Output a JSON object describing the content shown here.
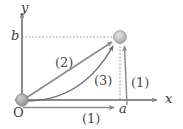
{
  "figure": {
    "type": "physics-path-diagram",
    "background_color": "#ffffff",
    "axes": {
      "x_label": "x",
      "y_label": "y",
      "origin_label": "O",
      "axis_color": "#8c8c8c",
      "origin": {
        "x": 22,
        "y": 100
      },
      "x_axis_end": {
        "x": 162,
        "y": 100
      },
      "y_axis_end": {
        "x": 22,
        "y": 10
      }
    },
    "tick_labels": {
      "x_tick": "a",
      "y_tick": "b"
    },
    "target_point": {
      "x": 120,
      "y": 37,
      "radius": 6,
      "fill_color": "#bdbdbd",
      "edge_color": "#9a9a9a"
    },
    "origin_point": {
      "x": 22,
      "y": 100,
      "radius": 6,
      "fill_color": "#a8a8a8",
      "edge_color": "#8a8a8a"
    },
    "guide_lines": {
      "style": "dotted",
      "color": "#9a9a9a",
      "horizontal_from_b": {
        "x1": 22,
        "y1": 37,
        "x2": 116,
        "y2": 37
      },
      "vertical_from_a": {
        "x1": 120,
        "y1": 96,
        "x2": 120,
        "y2": 44
      }
    },
    "paths": [
      {
        "id": "path-1-horizontal",
        "label": "(1)",
        "description": "horizontal segment along x from O to a",
        "style": "straight-arrow",
        "color": "#8c8c8c"
      },
      {
        "id": "path-1-vertical",
        "label": "(1)",
        "description": "vertical segment from a up to target point",
        "style": "straight-arrow",
        "color": "#8c8c8c"
      },
      {
        "id": "path-2-diagonal",
        "label": "(2)",
        "description": "straight diagonal arrow from O to target point",
        "style": "straight-arrow",
        "color": "#8c8c8c"
      },
      {
        "id": "path-3-curved",
        "label": "(3)",
        "description": "curved parabolic arrow from O to target point",
        "style": "curved-arrow",
        "color": "#6e6e6e"
      }
    ]
  }
}
